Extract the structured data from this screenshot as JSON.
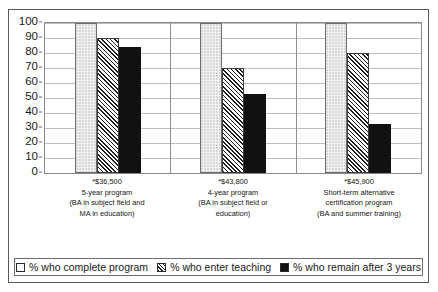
{
  "chart_data": {
    "type": "bar",
    "title": "",
    "xlabel": "",
    "ylabel": "",
    "ylim": [
      0,
      100
    ],
    "yticks": [
      0,
      10,
      20,
      30,
      40,
      50,
      60,
      70,
      80,
      90,
      100
    ],
    "grid": true,
    "legend_position": "bottom",
    "categories": [
      {
        "lines": [
          "*$36,500",
          "5-year program",
          "(BA in subject field and",
          "MA in education)"
        ]
      },
      {
        "lines": [
          "*$43,800",
          "4-year program",
          "(BA in subject field or",
          "education)"
        ]
      },
      {
        "lines": [
          "*$45,900",
          "Short-term alternative",
          "certification program",
          "(BA and summer training)"
        ]
      }
    ],
    "series": [
      {
        "name": "% who complete program",
        "swatch": "complete",
        "values": [
          100,
          100,
          100
        ]
      },
      {
        "name": "% who enter teaching",
        "swatch": "enter",
        "values": [
          90,
          70,
          80
        ]
      },
      {
        "name": "% who remain after 3 years",
        "swatch": "remain",
        "values": [
          84,
          53,
          33
        ]
      }
    ],
    "colors": {
      "complete_fill": "#f2f2f2",
      "enter_fill": "#ffffff",
      "enter_hatch": "#1f1f1f",
      "remain_fill": "#111111",
      "gridline": "#bdbdbd",
      "axis": "#8a8a8a",
      "frame": "#5a5a5a",
      "text": "#1a1a1a"
    }
  }
}
